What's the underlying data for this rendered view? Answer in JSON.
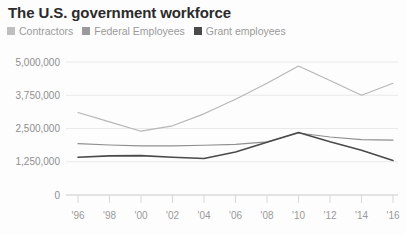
{
  "chart_data": {
    "type": "line",
    "title": "The U.S. government workforce",
    "xlabel": "",
    "ylabel": "",
    "x": [
      "'96",
      "'98",
      "'00",
      "'02",
      "'04",
      "'06",
      "'08",
      "'10",
      "'12",
      "'14",
      "'16"
    ],
    "x_tick_labels": [
      "'96",
      "'98",
      "'00",
      "'02",
      "'04",
      "'06",
      "'08",
      "'10",
      "'12",
      "'14",
      "'16"
    ],
    "y_tick_labels": [
      "0",
      "1,250,000",
      "2,500,000",
      "3,750,000",
      "5,000,000"
    ],
    "y_tick_values": [
      0,
      1250000,
      2500000,
      3750000,
      5000000
    ],
    "ylim": [
      0,
      5000000
    ],
    "grid": true,
    "legend_position": "top-left",
    "series": [
      {
        "name": "Contractors",
        "color": "#b6b6b6",
        "values": [
          3100000,
          2750000,
          2400000,
          2600000,
          3050000,
          3600000,
          4200000,
          4850000,
          4300000,
          3750000,
          4200000
        ]
      },
      {
        "name": "Federal Employees",
        "color": "#8f8f8f",
        "values": [
          1930000,
          1880000,
          1850000,
          1850000,
          1870000,
          1900000,
          2000000,
          2330000,
          2180000,
          2080000,
          2060000
        ]
      },
      {
        "name": "Grant employees",
        "color": "#4a4a4a",
        "values": [
          1420000,
          1470000,
          1480000,
          1420000,
          1370000,
          1620000,
          1980000,
          2350000,
          2000000,
          1680000,
          1300000
        ]
      }
    ]
  },
  "legend": {
    "items": [
      {
        "label": "Contractors",
        "color": "#bfbfbf"
      },
      {
        "label": "Federal Employees",
        "color": "#9a9a9a"
      },
      {
        "label": "Grant employees",
        "color": "#4a4a4a"
      }
    ]
  },
  "header": {
    "title": "The U.S. government workforce"
  }
}
